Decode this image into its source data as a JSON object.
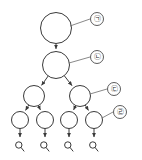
{
  "diagram": {
    "type": "tree",
    "background_color": "#ffffff",
    "node_stroke_color": "#3a3a3a",
    "node_fill_color": "#ffffff",
    "leader_line_color": "#6b6b6b",
    "levels": 4,
    "nodes": [
      {
        "id": "root",
        "level": 0,
        "cx": 56,
        "cy": 28,
        "r": 15.5
      },
      {
        "id": "n1",
        "level": 1,
        "cx": 56,
        "cy": 65,
        "r": 13.5
      },
      {
        "id": "n2-l",
        "level": 2,
        "cx": 34,
        "cy": 96,
        "r": 10.5
      },
      {
        "id": "n2-r",
        "level": 2,
        "cx": 80,
        "cy": 96,
        "r": 10.5
      },
      {
        "id": "n3-ll",
        "level": 3,
        "cx": 20,
        "cy": 120,
        "r": 8.5
      },
      {
        "id": "n3-lr",
        "level": 3,
        "cx": 45,
        "cy": 120,
        "r": 8.5
      },
      {
        "id": "n3-rl",
        "level": 3,
        "cx": 69,
        "cy": 120,
        "r": 8.5
      },
      {
        "id": "n3-rr",
        "level": 3,
        "cx": 94,
        "cy": 120,
        "r": 8.5
      }
    ],
    "edges": [
      {
        "from": "root",
        "to": "n1",
        "arrow": true
      },
      {
        "from": "n1",
        "to": "n2-l",
        "arrow": true
      },
      {
        "from": "n1",
        "to": "n2-r",
        "arrow": true
      },
      {
        "from": "n2-l",
        "to": "n3-ll",
        "arrow": true
      },
      {
        "from": "n2-l",
        "to": "n3-lr",
        "arrow": true
      },
      {
        "from": "n2-r",
        "to": "n3-rl",
        "arrow": true
      },
      {
        "from": "n2-r",
        "to": "n3-rr",
        "arrow": true
      }
    ],
    "terminals": [
      {
        "id": "t1",
        "from": "n3-ll",
        "cx": 20,
        "cy": 145,
        "glyph": "magnifier-glyph"
      },
      {
        "id": "t2",
        "from": "n3-lr",
        "cx": 45,
        "cy": 145,
        "glyph": "magnifier-glyph"
      },
      {
        "id": "t3",
        "from": "n3-rl",
        "cx": 69,
        "cy": 145,
        "glyph": "magnifier-glyph"
      },
      {
        "id": "t4",
        "from": "n3-rr",
        "cx": 94,
        "cy": 145,
        "glyph": "magnifier-glyph"
      }
    ],
    "callouts": [
      {
        "id": "callout-1",
        "label": "㉠",
        "target_node": "root",
        "cx": 97,
        "cy": 19,
        "r": 6.5,
        "leader_from_x": 70,
        "leader_from_y": 26,
        "leader_to_x": 90,
        "leader_to_y": 19
      },
      {
        "id": "callout-2",
        "label": "㉡",
        "target_node": "n1",
        "cx": 97,
        "cy": 57,
        "r": 6.5,
        "leader_from_x": 69,
        "leader_from_y": 63,
        "leader_to_x": 90,
        "leader_to_y": 57
      },
      {
        "id": "callout-3",
        "label": "㉢",
        "target_node": "n2-r",
        "cx": 114,
        "cy": 89,
        "r": 6.5,
        "leader_from_x": 90,
        "leader_from_y": 94,
        "leader_to_x": 107,
        "leader_to_y": 89
      },
      {
        "id": "callout-4",
        "label": "㉣",
        "target_node": "n3-rr",
        "cx": 120,
        "cy": 112,
        "r": 6.5,
        "leader_from_x": 102,
        "leader_from_y": 118,
        "leader_to_x": 113,
        "leader_to_y": 112
      }
    ]
  }
}
